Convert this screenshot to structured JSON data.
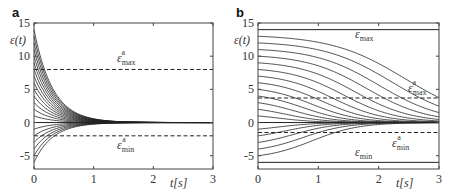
{
  "chart_data": [
    {
      "type": "line",
      "panel": "a",
      "title": "",
      "xlabel": "t[s]",
      "ylabel": "ε(t)",
      "xlim": [
        0,
        3
      ],
      "ylim": [
        -7,
        15
      ],
      "xticks": [
        0,
        1,
        2,
        3
      ],
      "yticks": [
        -5,
        0,
        5,
        10,
        15
      ],
      "grid": false,
      "behavior": "exponential decay to 0",
      "decay_rate": 3.2,
      "initial_values": [
        14,
        13,
        12,
        11,
        10,
        9,
        8,
        7,
        6,
        5,
        4,
        3,
        2,
        1,
        -1,
        -2,
        -3,
        -4,
        -5,
        -6
      ],
      "reference_lines": [
        {
          "name": "ε_max^a",
          "value": 8,
          "style": "dashed",
          "label_x": 1.6,
          "label_y": 10
        },
        {
          "name": "ε_min^a",
          "value": -2,
          "style": "dashed",
          "label_x": 1.6,
          "label_y": -4.2
        },
        {
          "name": "zero",
          "value": 0,
          "style": "solid"
        }
      ]
    },
    {
      "type": "line",
      "panel": "b",
      "title": "",
      "xlabel": "t[s]",
      "ylabel": "ε(t)",
      "xlim": [
        0,
        3
      ],
      "ylim": [
        -7,
        15
      ],
      "xticks": [
        0,
        1,
        2,
        3
      ],
      "yticks": [
        -5,
        0,
        5,
        10,
        15
      ],
      "grid": false,
      "behavior": "sigmoidal decay to 0, larger initial values decay later",
      "initial_values": [
        13,
        12,
        11,
        10,
        9,
        8,
        7,
        6,
        5,
        4,
        3,
        2,
        1,
        -1,
        -2,
        -3,
        -4,
        -5
      ],
      "reference_lines": [
        {
          "name": "ε_max",
          "value": 14,
          "style": "solid",
          "label_x": 1.65,
          "label_y": 12.9
        },
        {
          "name": "ε_max^a",
          "value": 3.7,
          "style": "dashed",
          "label_x": 2.65,
          "label_y": 5
        },
        {
          "name": "ε_min^a",
          "value": -1.5,
          "style": "dashed",
          "label_x": 2.35,
          "label_y": -4
        },
        {
          "name": "ε_min",
          "value": -6,
          "style": "solid",
          "label_x": 1.65,
          "label_y": -5.4
        },
        {
          "name": "zero",
          "value": 0,
          "style": "solid"
        }
      ]
    }
  ],
  "panels": {
    "a": {
      "letter": "a",
      "ylabel": "ε(t)",
      "xlabel": "t[s]",
      "eps_max_a": {
        "base": "ε",
        "sub": "max",
        "sup": "a"
      },
      "eps_min_a": {
        "base": "ε",
        "sub": "min",
        "sup": "a"
      }
    },
    "b": {
      "letter": "b",
      "ylabel": "ε(t)",
      "xlabel": "t[s]",
      "eps_max": {
        "base": "ε",
        "sub": "max"
      },
      "eps_min": {
        "base": "ε",
        "sub": "min"
      },
      "eps_max_a": {
        "base": "ε",
        "sub": "max",
        "sup": "a"
      },
      "eps_min_a": {
        "base": "ε",
        "sub": "min",
        "sup": "a"
      }
    }
  },
  "colors": {
    "line": "#222222",
    "axis": "#444444",
    "background": "#ffffff"
  }
}
